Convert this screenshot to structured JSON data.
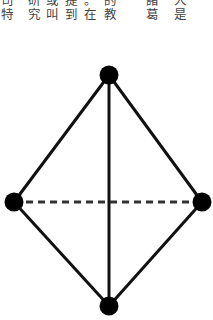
{
  "text_columns": [
    {
      "x": 0,
      "chars": [
        "司",
        "特"
      ]
    },
    {
      "x": 27,
      "chars": [
        "研",
        "究"
      ]
    },
    {
      "x": 45,
      "chars": [
        "或",
        "叫"
      ]
    },
    {
      "x": 64,
      "chars": [
        "提",
        "到"
      ]
    },
    {
      "x": 83,
      "chars": [
        "。",
        "在"
      ]
    },
    {
      "x": 103,
      "chars": [
        "的",
        "教"
      ]
    },
    {
      "x": 145,
      "chars": [
        "諸",
        "葛"
      ]
    },
    {
      "x": 173,
      "chars": [
        "人",
        "是"
      ]
    }
  ],
  "diagram": {
    "type": "graph",
    "nodes": [
      {
        "id": "top",
        "x": 109,
        "y": 75
      },
      {
        "id": "left",
        "x": 14,
        "y": 202
      },
      {
        "id": "right",
        "x": 202,
        "y": 202
      },
      {
        "id": "bottom",
        "x": 109,
        "y": 306
      }
    ],
    "edges": [
      {
        "from": "top",
        "to": "left",
        "style": "solid"
      },
      {
        "from": "top",
        "to": "right",
        "style": "solid"
      },
      {
        "from": "top",
        "to": "bottom",
        "style": "solid"
      },
      {
        "from": "left",
        "to": "bottom",
        "style": "solid"
      },
      {
        "from": "right",
        "to": "bottom",
        "style": "solid"
      },
      {
        "from": "left",
        "to": "right",
        "style": "dashed"
      }
    ],
    "node_radius": 9.5,
    "stroke_color": "#111111",
    "dash_color": "#333333"
  }
}
